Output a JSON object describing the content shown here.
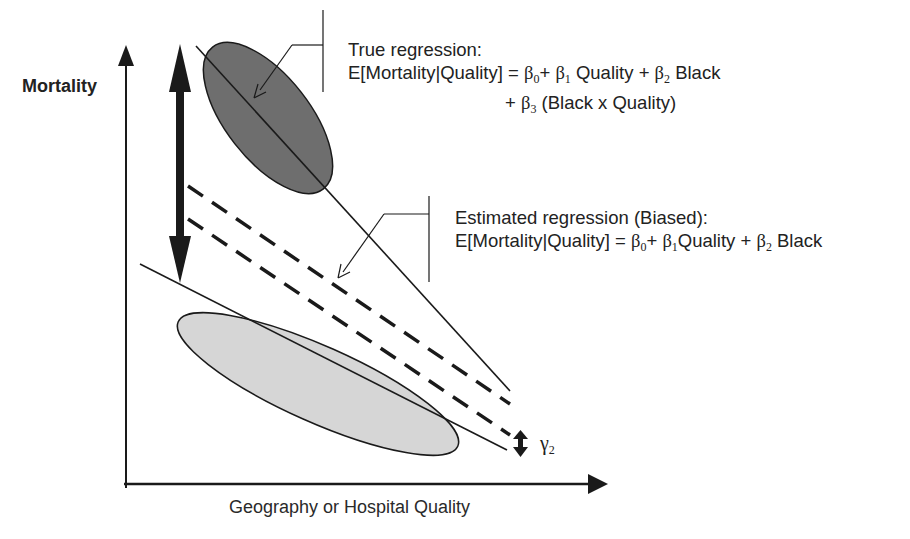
{
  "axes": {
    "y_label": "Mortality",
    "x_label": "Geography or Hospital Quality"
  },
  "annotations": {
    "true_regression": {
      "title": "True regression:",
      "lhs": "E[Mortality|Quality] = ",
      "b0": "β",
      "b0_sub": "0",
      "plus1": "+ ",
      "b1": "β",
      "b1_sub": "1",
      "term1": " Quality + ",
      "b2": "β",
      "b2_sub": "2",
      "term2": " Black",
      "line2_plus": "+ ",
      "b3": "β",
      "b3_sub": "3",
      "term3": " (Black x Quality)"
    },
    "estimated_regression": {
      "title": "Estimated regression (Biased):",
      "lhs": "E[Mortality|Quality] = ",
      "b0": "β",
      "b0_sub": "0",
      "plus1": "+ ",
      "b1": "β",
      "b1_sub": "1",
      "term1": "Quality + ",
      "b2": "β",
      "b2_sub": "2",
      "term2": " Black"
    },
    "gamma_label": "γ",
    "gamma_sub": "2"
  },
  "colors": {
    "dark_ellipse": "#6e6e6e",
    "light_ellipse": "#d6d6d6",
    "lines": "#1a1a1a"
  }
}
